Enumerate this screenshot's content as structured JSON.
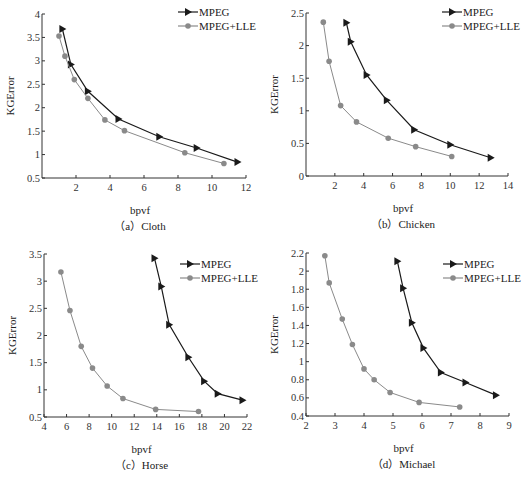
{
  "figure": {
    "colors": {
      "mpeg": "#1a1a1a",
      "lle": "#8a8a8a",
      "axis": "#333333"
    }
  },
  "chart_data": [
    {
      "type": "line",
      "id": "a",
      "caption": "（a）Cloth",
      "xlabel": "bpvf",
      "ylabel": "KGError",
      "xlim": [
        0,
        12
      ],
      "ylim": [
        0.5,
        4
      ],
      "xticks": [
        2,
        4,
        6,
        8,
        10,
        12
      ],
      "yticks": [
        0.5,
        1,
        1.5,
        2,
        2.5,
        3,
        3.5,
        4
      ],
      "grid": false,
      "legend_position": "upper right",
      "frame": {
        "x0": 42,
        "x1": 246,
        "y0": 178,
        "y1": 14
      },
      "legend": {
        "x": 178,
        "y": 12
      },
      "series": [
        {
          "name": "MPEG",
          "marker": "triangle-right",
          "x": [
            1.2,
            1.7,
            2.7,
            4.5,
            6.9,
            9.1,
            11.5
          ],
          "y": [
            3.68,
            2.92,
            2.35,
            1.76,
            1.38,
            1.14,
            0.84
          ]
        },
        {
          "name": "MPEG+LLE",
          "marker": "circle",
          "x": [
            1.0,
            1.35,
            1.9,
            2.7,
            3.7,
            4.85,
            8.4,
            10.7
          ],
          "y": [
            3.53,
            3.1,
            2.6,
            2.2,
            1.74,
            1.51,
            1.04,
            0.81
          ]
        }
      ]
    },
    {
      "type": "line",
      "id": "b",
      "caption": "（b）Chicken",
      "xlabel": "bpvf",
      "ylabel": "KGError",
      "xlim": [
        0,
        14
      ],
      "ylim": [
        0,
        2.5
      ],
      "xticks": [
        2,
        4,
        6,
        8,
        10,
        12,
        14
      ],
      "yticks": [
        0,
        0.5,
        1,
        1.5,
        2,
        2.5
      ],
      "grid": false,
      "legend_position": "upper right",
      "frame": {
        "x0": 306,
        "x1": 508,
        "y0": 176,
        "y1": 13
      },
      "legend": {
        "x": 442,
        "y": 12
      },
      "series": [
        {
          "name": "MPEG",
          "marker": "triangle-right",
          "x": [
            2.8,
            3.1,
            4.2,
            5.6,
            7.5,
            10.0,
            12.8
          ],
          "y": [
            2.35,
            2.06,
            1.55,
            1.16,
            0.71,
            0.48,
            0.28
          ]
        },
        {
          "name": "MPEG+LLE",
          "marker": "circle",
          "x": [
            1.2,
            1.6,
            2.4,
            3.5,
            5.7,
            7.6,
            10.1
          ],
          "y": [
            2.36,
            1.76,
            1.08,
            0.83,
            0.58,
            0.45,
            0.3
          ]
        }
      ]
    },
    {
      "type": "line",
      "id": "c",
      "caption": "（c）Horse",
      "xlabel": "bpvf",
      "ylabel": "KGError",
      "xlim": [
        4,
        22
      ],
      "ylim": [
        0.5,
        3.5
      ],
      "xticks": [
        4,
        6,
        8,
        10,
        12,
        14,
        16,
        18,
        20,
        22
      ],
      "yticks": [
        0.5,
        1,
        1.5,
        2,
        2.5,
        3,
        3.5
      ],
      "grid": false,
      "legend_position": "upper right",
      "frame": {
        "x0": 44,
        "x1": 247,
        "y0": 417,
        "y1": 254
      },
      "legend": {
        "x": 180,
        "y": 264
      },
      "series": [
        {
          "name": "MPEG",
          "marker": "triangle-right",
          "x": [
            13.8,
            14.4,
            15.1,
            16.8,
            18.2,
            19.4,
            21.6
          ],
          "y": [
            3.42,
            2.9,
            2.2,
            1.6,
            1.16,
            0.93,
            0.81
          ]
        },
        {
          "name": "MPEG+LLE",
          "marker": "circle",
          "x": [
            5.5,
            6.3,
            7.3,
            8.3,
            9.6,
            11.0,
            13.9,
            17.7
          ],
          "y": [
            3.17,
            2.46,
            1.8,
            1.4,
            1.07,
            0.84,
            0.64,
            0.6
          ]
        }
      ]
    },
    {
      "type": "line",
      "id": "d",
      "caption": "（d）Michael",
      "xlabel": "bpvf",
      "ylabel": "KGError",
      "xlim": [
        2,
        9
      ],
      "ylim": [
        0.4,
        2.2
      ],
      "xticks": [
        2,
        3,
        4,
        5,
        6,
        7,
        8,
        9
      ],
      "yticks": [
        0.4,
        0.6,
        0.8,
        1,
        1.2,
        1.4,
        1.6,
        1.8,
        2,
        2.2
      ],
      "grid": false,
      "legend_position": "upper right",
      "frame": {
        "x0": 306,
        "x1": 509,
        "y0": 416,
        "y1": 253
      },
      "legend": {
        "x": 443,
        "y": 264
      },
      "series": [
        {
          "name": "MPEG",
          "marker": "triangle-right",
          "x": [
            5.15,
            5.35,
            5.65,
            6.05,
            6.65,
            7.5,
            8.55
          ],
          "y": [
            2.11,
            1.81,
            1.43,
            1.15,
            0.88,
            0.77,
            0.63
          ]
        },
        {
          "name": "MPEG+LLE",
          "marker": "circle",
          "x": [
            2.65,
            2.8,
            3.25,
            3.6,
            4.0,
            4.35,
            4.9,
            5.9,
            7.3
          ],
          "y": [
            2.17,
            1.87,
            1.47,
            1.19,
            0.92,
            0.8,
            0.66,
            0.55,
            0.5
          ]
        }
      ]
    }
  ]
}
